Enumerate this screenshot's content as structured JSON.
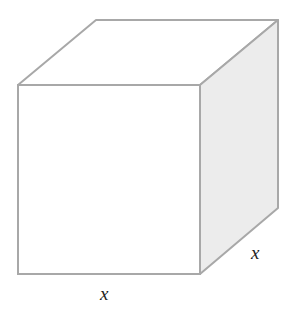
{
  "diagram": {
    "type": "cube",
    "colors": {
      "edge": "#a8a8a8",
      "front_face": "#ffffff",
      "top_face": "#ffffff",
      "side_face": "#ececec"
    },
    "labels": {
      "bottom_edge": "x",
      "depth_edge": "x"
    }
  }
}
